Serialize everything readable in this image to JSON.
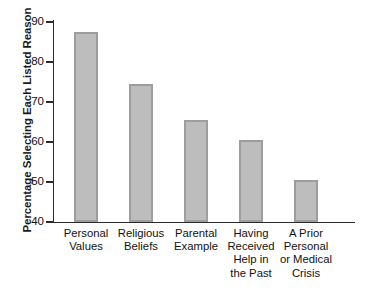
{
  "chart_data": {
    "type": "bar",
    "title": "",
    "xlabel": "",
    "ylabel": "Percentage Selecting Each Listed Reason",
    "ylim": [
      40,
      90
    ],
    "yticks": [
      40,
      50,
      60,
      70,
      80,
      90
    ],
    "grid": false,
    "legend": null,
    "categories": [
      "Personal Values",
      "Religious Beliefs",
      "Parental Example",
      "Having Received Help in the Past",
      "A Prior Personal or Medical Crisis"
    ],
    "category_lines": [
      [
        "Personal",
        "Values"
      ],
      [
        "Religious",
        "Beliefs"
      ],
      [
        "Parental",
        "Example"
      ],
      [
        "Having",
        "Received",
        "Help in",
        "the Past"
      ],
      [
        "A Prior",
        "Personal",
        "or Medical",
        "Crisis"
      ]
    ],
    "values": [
      87.5,
      74.5,
      65.5,
      60.5,
      50.5
    ],
    "bar_color": "#bdbdbd",
    "bar_border_color": "#9d9d9d",
    "axis_color": "#2b2b2b",
    "background": "#ffffff"
  },
  "axis": {
    "y_title": "Percentage Selecting Each Listed Reason",
    "tick_labels": [
      "90",
      "80",
      "70",
      "60",
      "50",
      "40"
    ]
  }
}
